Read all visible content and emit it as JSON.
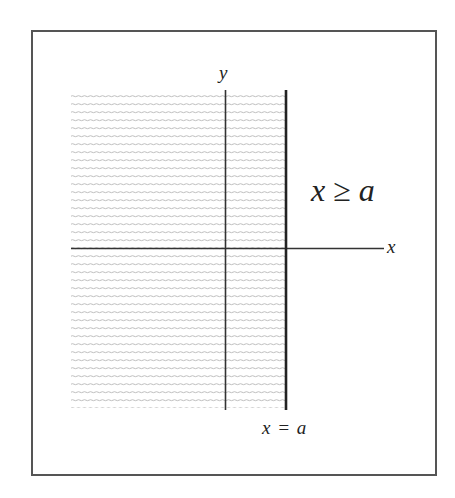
{
  "diagram": {
    "type": "region-inequality-plot",
    "axes": {
      "x_label": "x",
      "y_label": "y"
    },
    "boundary_line": {
      "label": "x = a",
      "orientation": "vertical"
    },
    "region_label": "x ≥ a",
    "shaded_side": "left of boundary",
    "shading_style": "horizontal hatch lines",
    "colors": {
      "frame": "#555555",
      "axes": "#333333",
      "boundary": "#222222",
      "hatch": "#b8b8b8",
      "text": "#222222"
    }
  }
}
